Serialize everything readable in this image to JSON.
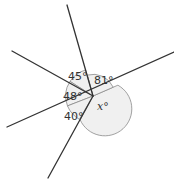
{
  "diagram": {
    "type": "angles-around-a-point",
    "angles": [
      {
        "id": "a45",
        "label": "45°",
        "value": 45
      },
      {
        "id": "a81",
        "label": "81°",
        "value": 81
      },
      {
        "id": "ax",
        "label": "x°",
        "value": null,
        "variable": "x"
      },
      {
        "id": "a40",
        "label": "40°",
        "value": 40
      },
      {
        "id": "a48",
        "label": "48°",
        "value": 48
      }
    ],
    "labels": {
      "a45": "45°",
      "a81": "81°",
      "ax_var": "x",
      "ax_deg": "°",
      "a40": "40°",
      "a48": "48°"
    }
  }
}
